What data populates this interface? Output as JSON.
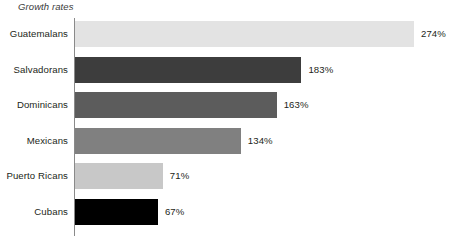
{
  "chart_data": {
    "type": "bar",
    "orientation": "horizontal",
    "title": "Growth rates",
    "xlabel": "",
    "ylabel": "",
    "grid": false,
    "legend": false,
    "axis_color": "#8a8a8a",
    "xlim": [
      0,
      274
    ],
    "categories": [
      "Guatemalans",
      "Salvadorans",
      "Dominicans",
      "Mexicans",
      "Puerto Ricans",
      "Cubans"
    ],
    "values": [
      274,
      183,
      163,
      134,
      71,
      67
    ],
    "value_labels": [
      "274%",
      "183%",
      "163%",
      "134%",
      "71%",
      "67%"
    ],
    "colors": [
      "#e3e3e3",
      "#3d3d3d",
      "#5c5c5c",
      "#808080",
      "#c8c8c8",
      "#000000"
    ],
    "bars": [
      {
        "category": "Guatemalans",
        "value": 274,
        "label": "274%",
        "color": "#e3e3e3"
      },
      {
        "category": "Salvadorans",
        "value": 183,
        "label": "183%",
        "color": "#3d3d3d"
      },
      {
        "category": "Dominicans",
        "value": 163,
        "label": "163%",
        "color": "#5c5c5c"
      },
      {
        "category": "Mexicans",
        "value": 134,
        "label": "134%",
        "color": "#808080"
      },
      {
        "category": "Puerto Ricans",
        "value": 71,
        "label": "71%",
        "color": "#c8c8c8"
      },
      {
        "category": "Cubans",
        "value": 67,
        "label": "67%",
        "color": "#000000"
      }
    ]
  }
}
